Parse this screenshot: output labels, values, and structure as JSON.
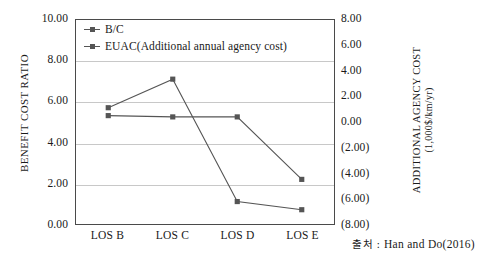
{
  "chart_data": {
    "type": "line",
    "title": "",
    "subtitle": "",
    "categories": [
      "LOS B",
      "LOS C",
      "LOS D",
      "LOS E"
    ],
    "series": [
      {
        "name": "B/C",
        "axis": "left",
        "values": [
          5.7,
          7.1,
          1.1,
          0.7
        ],
        "color": "#555555",
        "marker": "square"
      },
      {
        "name": "EUAC(Additional annual agency cost)",
        "axis": "right",
        "values": [
          0.5,
          0.4,
          0.4,
          -4.5
        ],
        "color": "#555555",
        "marker": "square"
      }
    ],
    "xlabel": "",
    "ylabel": "BENEFIT COST RATIO",
    "y2label_line1": "ADDITIONAL AGENCY COST",
    "y2label_line2": "(1,000$/km/yr)",
    "ylim": [
      0.0,
      10.0
    ],
    "y2lim": [
      -8.0,
      8.0
    ],
    "ytick_labels": [
      "10.00",
      "8.00",
      "6.00",
      "4.00",
      "2.00",
      "0.00"
    ],
    "ytick_values": [
      10.0,
      8.0,
      6.0,
      4.0,
      2.0,
      0.0
    ],
    "y2tick_labels": [
      "8.00",
      "6.00",
      "4.00",
      "2.00",
      "0.00",
      "(2.00)",
      "(4.00)",
      "(6.00)",
      "(8.00)"
    ],
    "y2tick_values": [
      8.0,
      6.0,
      4.0,
      2.0,
      0.0,
      -2.0,
      -4.0,
      -6.0,
      -8.0
    ],
    "grid": true,
    "grid_axis": "y",
    "legend_position": "top-left"
  },
  "legend": {
    "items": [
      {
        "label": "B/C"
      },
      {
        "label": "EUAC(Additional annual agency cost)"
      }
    ]
  },
  "axes": {
    "left_title": "BENEFIT COST RATIO",
    "right_title_line1": "ADDITIONAL AGENCY COST",
    "right_title_line2": "(1,000$/km/yr)"
  },
  "source": {
    "label": "출처",
    "separator": " : ",
    "text": "Han  and  Do(2016)"
  },
  "colors": {
    "line": "#555555",
    "grid": "#c8c8c8",
    "frame": "#4a4a4a",
    "text": "#1a1a1a",
    "background": "#ffffff"
  }
}
